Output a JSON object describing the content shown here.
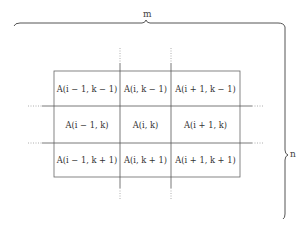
{
  "labels": {
    "top_brace": "m",
    "right_brace": "n"
  },
  "grid": {
    "rows": [
      [
        "A(i − 1, k − 1)",
        "A(i, k − 1)",
        "A(i + 1, k − 1)"
      ],
      [
        "A(i − 1, k)",
        "A(i, k)",
        "A(i + 1, k)"
      ],
      [
        "A(i − 1, k + 1)",
        "A(i, k + 1)",
        "A(i + 1, k + 1)"
      ]
    ]
  },
  "colors": {
    "line": "#555555",
    "dotted": "#999999",
    "text": "#333333"
  }
}
